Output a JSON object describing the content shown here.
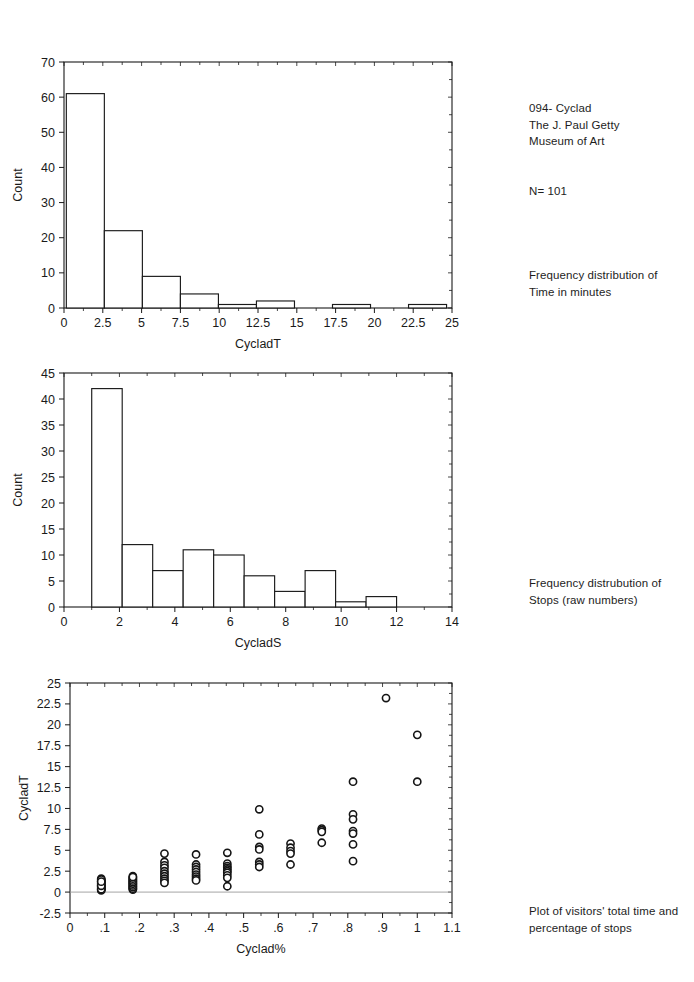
{
  "notes": {
    "title": "094- Cyclad\nThe J. Paul Getty\nMuseum of Art",
    "sample_size": "N= 101",
    "caption_1": "Frequency distribution of\nTime in minutes",
    "caption_2": "Frequency distrubution of\nStops (raw numbers)",
    "caption_3": "Plot of visitors' total time and\npercentage of stops"
  },
  "chart_data": [
    {
      "type": "bar",
      "title": "",
      "xlabel": "CycladT",
      "ylabel": "Count",
      "xlim": [
        0,
        25
      ],
      "ylim": [
        0,
        70
      ],
      "xticks": [
        "0",
        "2.5",
        "5",
        "7.5",
        "10",
        "12.5",
        "15",
        "17.5",
        "20",
        "22.5",
        "25"
      ],
      "xtick_values": [
        0,
        2.5,
        5,
        7.5,
        10,
        12.5,
        15,
        17.5,
        20,
        22.5,
        25
      ],
      "yticks": [
        "0",
        "10",
        "20",
        "30",
        "40",
        "50",
        "60",
        "70"
      ],
      "ytick_values": [
        0,
        10,
        20,
        30,
        40,
        50,
        60,
        70
      ],
      "grid": false,
      "bin_edges": [
        0.15,
        2.6,
        5.05,
        7.5,
        9.95,
        12.4,
        14.85,
        17.3,
        19.75,
        22.2,
        24.65
      ],
      "categories": [
        "0.15-2.6",
        "2.6-5.05",
        "5.05-7.5",
        "7.5-9.95",
        "9.95-12.4",
        "12.4-14.85",
        "14.85-17.3",
        "17.3-19.75",
        "19.75-22.2",
        "22.2-24.65"
      ],
      "values": [
        61,
        22,
        9,
        4,
        1,
        2,
        0,
        1,
        0,
        1
      ]
    },
    {
      "type": "bar",
      "title": "",
      "xlabel": "CycladS",
      "ylabel": "Count",
      "xlim": [
        0,
        14
      ],
      "ylim": [
        0,
        45
      ],
      "xticks": [
        "0",
        "2",
        "4",
        "6",
        "8",
        "10",
        "12",
        "14"
      ],
      "xtick_values": [
        0,
        2,
        4,
        6,
        8,
        10,
        12,
        14
      ],
      "yticks": [
        "0",
        "5",
        "10",
        "15",
        "20",
        "25",
        "30",
        "35",
        "40",
        "45"
      ],
      "ytick_values": [
        0,
        5,
        10,
        15,
        20,
        25,
        30,
        35,
        40,
        45
      ],
      "grid": false,
      "bin_edges": [
        1.0,
        2.1,
        3.2,
        4.3,
        5.4,
        6.5,
        7.6,
        8.7,
        9.8,
        10.9,
        12.0
      ],
      "categories": [
        "1-2.1",
        "2.1-3.2",
        "3.2-4.3",
        "4.3-5.4",
        "5.4-6.5",
        "6.5-7.6",
        "7.6-8.7",
        "8.7-9.8",
        "9.8-10.9",
        "10.9-12"
      ],
      "values": [
        42,
        12,
        7,
        11,
        10,
        6,
        3,
        7,
        1,
        2
      ]
    },
    {
      "type": "scatter",
      "title": "",
      "xlabel": "Cyclad%",
      "ylabel": "CycladT",
      "xlim": [
        0,
        1.1
      ],
      "ylim": [
        -2.5,
        25
      ],
      "xticks": [
        "0",
        ".1",
        ".2",
        ".3",
        ".4",
        ".5",
        ".6",
        ".7",
        ".8",
        ".9",
        "1",
        "1.1"
      ],
      "xtick_values": [
        0,
        0.1,
        0.2,
        0.3,
        0.4,
        0.5,
        0.6,
        0.7,
        0.8,
        0.9,
        1.0,
        1.1
      ],
      "yticks": [
        "-2.5",
        "0",
        "2.5",
        "5",
        "7.5",
        "10",
        "12.5",
        "15",
        "17.5",
        "20",
        "22.5",
        "25"
      ],
      "ytick_values": [
        -2.5,
        0,
        2.5,
        5,
        7.5,
        10,
        12.5,
        15,
        17.5,
        20,
        22.5,
        25
      ],
      "grid": false,
      "zero_line": 0,
      "x": [
        0.09,
        0.09,
        0.09,
        0.09,
        0.09,
        0.09,
        0.09,
        0.09,
        0.09,
        0.09,
        0.09,
        0.09,
        0.09,
        0.09,
        0.09,
        0.09,
        0.09,
        0.09,
        0.181,
        0.181,
        0.181,
        0.181,
        0.181,
        0.181,
        0.181,
        0.181,
        0.181,
        0.181,
        0.181,
        0.181,
        0.181,
        0.181,
        0.181,
        0.181,
        0.181,
        0.272,
        0.272,
        0.272,
        0.272,
        0.272,
        0.272,
        0.272,
        0.272,
        0.272,
        0.272,
        0.363,
        0.363,
        0.363,
        0.363,
        0.363,
        0.363,
        0.363,
        0.363,
        0.363,
        0.453,
        0.453,
        0.453,
        0.453,
        0.453,
        0.453,
        0.453,
        0.453,
        0.453,
        0.453,
        0.545,
        0.545,
        0.545,
        0.545,
        0.545,
        0.545,
        0.545,
        0.635,
        0.635,
        0.635,
        0.635,
        0.635,
        0.725,
        0.725,
        0.725,
        0.725,
        0.815,
        0.815,
        0.815,
        0.815,
        0.815,
        0.815,
        0.815,
        0.91,
        1.0,
        1.0
      ],
      "y": [
        0.2,
        0.4,
        0.6,
        0.8,
        1.0,
        1.2,
        1.4,
        1.6,
        0.3,
        0.5,
        0.7,
        0.9,
        1.1,
        1.3,
        1.5,
        0.35,
        0.75,
        1.25,
        0.3,
        0.5,
        0.7,
        0.9,
        1.1,
        1.3,
        1.5,
        1.7,
        1.9,
        0.4,
        0.6,
        0.8,
        1.0,
        1.2,
        1.4,
        1.6,
        1.8,
        4.6,
        3.6,
        3.2,
        2.9,
        2.5,
        2.2,
        1.9,
        1.6,
        1.35,
        1.1,
        4.5,
        3.3,
        3.0,
        2.7,
        2.4,
        2.1,
        1.85,
        1.6,
        1.4,
        4.7,
        3.4,
        3.1,
        2.9,
        2.7,
        2.5,
        2.3,
        2.0,
        1.7,
        0.7,
        9.9,
        6.9,
        5.4,
        5.1,
        3.6,
        3.3,
        3.0,
        5.8,
        5.3,
        4.9,
        4.6,
        3.3,
        7.6,
        7.4,
        7.2,
        5.9,
        13.2,
        9.3,
        8.7,
        7.3,
        7.0,
        5.7,
        3.7,
        23.2,
        18.8,
        13.2
      ]
    }
  ],
  "colors": {
    "ink": "#1a1a1a",
    "background": "#ffffff",
    "zero_line": "#9a9a9a"
  }
}
